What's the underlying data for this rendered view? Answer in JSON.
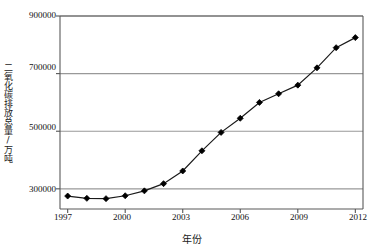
{
  "chart_data": {
    "type": "line",
    "title": "",
    "xlabel": "年份",
    "ylabel": "二氧化碳排放总量/万吨",
    "x": [
      1997,
      1998,
      1999,
      2000,
      2001,
      2002,
      2003,
      2004,
      2005,
      2006,
      2007,
      2008,
      2009,
      2010,
      2011,
      2012
    ],
    "values": [
      275000,
      267000,
      266000,
      276000,
      293000,
      318000,
      362000,
      432000,
      496000,
      545000,
      600000,
      630000,
      660000,
      720000,
      790000,
      825000
    ],
    "series": [
      {
        "name": "二氧化碳排放总量",
        "values": [
          275000,
          267000,
          266000,
          276000,
          293000,
          318000,
          362000,
          432000,
          496000,
          545000,
          600000,
          630000,
          660000,
          720000,
          790000,
          825000
        ]
      }
    ],
    "xtick_labels": [
      "1997",
      "2000",
      "2003",
      "2006",
      "2009",
      "2012"
    ],
    "xtick_values": [
      1997,
      2000,
      2003,
      2006,
      2009,
      2012
    ],
    "ytick_labels": [
      "300000",
      "500000",
      "700000",
      "900000"
    ],
    "ytick_values": [
      300000,
      500000,
      700000,
      900000
    ],
    "xlim": [
      1996.6,
      2012.4
    ],
    "ylim": [
      230000,
      900000
    ],
    "grid": "horizontal",
    "legend": "none",
    "marker": "diamond",
    "marker_color": "#000000",
    "line_color": "#1a1a1a",
    "gridline_color": "#999999",
    "axis_color": "#555555",
    "background": "#ffffff"
  },
  "axes": {
    "y_title": "二氧化碳排放总量/万吨",
    "x_title": "年份"
  }
}
